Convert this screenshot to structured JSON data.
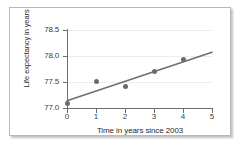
{
  "chart_data": {
    "type": "scatter",
    "title": "",
    "xlabel": "Time in years since 2003",
    "ylabel": "Life expectancy in years",
    "xlim": [
      0,
      5
    ],
    "ylim": [
      77.0,
      78.5
    ],
    "grid": true,
    "legend": "none",
    "x_ticks": [
      "0",
      "1",
      "2",
      "3",
      "4",
      "5"
    ],
    "x_tick_values": [
      0,
      1,
      2,
      3,
      4,
      5
    ],
    "y_ticks": [
      "77.0",
      "77.5",
      "78.0",
      "78.5"
    ],
    "y_tick_values": [
      77.0,
      77.5,
      78.0,
      78.5
    ],
    "points": [
      {
        "x": 0,
        "y": 77.08
      },
      {
        "x": 1,
        "y": 77.51
      },
      {
        "x": 2,
        "y": 77.42
      },
      {
        "x": 3,
        "y": 77.71
      },
      {
        "x": 4,
        "y": 77.93
      }
    ],
    "series": [
      {
        "name": "Life expectancy",
        "type": "scatter",
        "x": [
          0,
          1,
          2,
          3,
          4
        ],
        "values": [
          77.08,
          77.51,
          77.42,
          77.71,
          77.93
        ],
        "marker_color": "#6b6b6b"
      },
      {
        "name": "Trend line",
        "type": "line",
        "x": [
          0,
          5
        ],
        "values": [
          77.14,
          78.07
        ],
        "line_color": "#6e6e6e"
      }
    ],
    "point_labels": [
      "(0, 77.08)",
      "(1, 77.51)",
      "(2, 77.42)",
      "(3, 77.71)",
      "(4, 77.93)"
    ]
  },
  "axes": {
    "y_tick_labels": [
      "78.5",
      "78.0",
      "77.5",
      "77.0"
    ],
    "x_tick_labels": [
      "0",
      "1",
      "2",
      "3",
      "4",
      "5"
    ],
    "y_title": "Life expectancy in years",
    "x_title": "Time in years since 2003"
  },
  "colors": {
    "marker": "#6b6b6b",
    "trend_line": "#6e6e6e",
    "axis": "#6e6e6e",
    "gridline": "#ededed",
    "card_border": "#b9b9b9",
    "text": "#2b2b2b",
    "background": "#ffffff"
  }
}
